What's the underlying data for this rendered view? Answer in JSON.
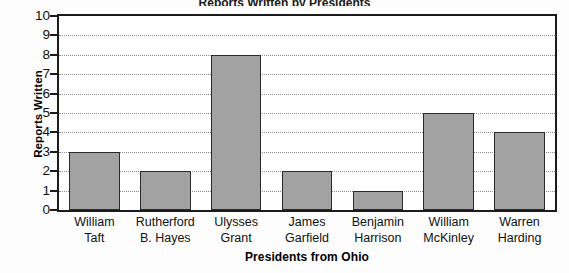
{
  "chart_data": {
    "type": "bar",
    "title": "Reports Written by Presidents",
    "xlabel": "Presidents from Ohio",
    "ylabel": "Reports Written",
    "categories": [
      "William Taft",
      "Rutherford B. Hayes",
      "Ulysses Grant",
      "James Garfield",
      "Benjamin Harrison",
      "William McKinley",
      "Warren Harding"
    ],
    "category_lines": [
      [
        "William",
        "Taft"
      ],
      [
        "Rutherford",
        "B. Hayes"
      ],
      [
        "Ulysses",
        "Grant"
      ],
      [
        "James",
        "Garfield"
      ],
      [
        "Benjamin",
        "Harrison"
      ],
      [
        "William",
        "McKinley"
      ],
      [
        "Warren",
        "Harding"
      ]
    ],
    "values": [
      3,
      2,
      8,
      2,
      1,
      5,
      4
    ],
    "ylim": [
      0,
      10
    ],
    "yticks": [
      0,
      1,
      2,
      3,
      4,
      5,
      6,
      7,
      8,
      9,
      10
    ],
    "ytick_labels": [
      "0",
      "1",
      "2",
      "3",
      "4",
      "5",
      "6",
      "7",
      "8",
      "9",
      "10"
    ],
    "grid": true,
    "grid_axis": "y",
    "grid_style": "dotted",
    "legend": null,
    "bar_fill_color": "#a2a2a2",
    "bar_edge_color": "#2a2a2a",
    "axis_color": "#1b1b1b",
    "grid_color": "#8d8d8d",
    "background_color": "#ffffff"
  }
}
